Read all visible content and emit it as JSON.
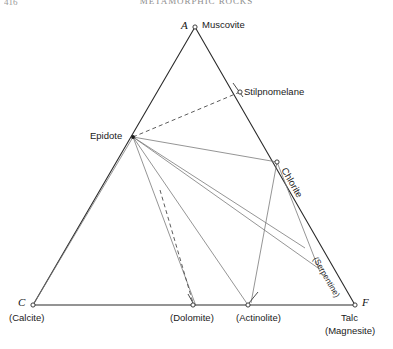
{
  "page": {
    "running_head": "METAMORPHIC ROCKS",
    "folio": "416"
  },
  "figure": {
    "type": "acf-ternary-diagram",
    "vertices": {
      "a": {
        "code": "A",
        "mineral": "Muscovite",
        "x": 195,
        "y": 27
      },
      "c": {
        "code": "C",
        "mineral": "(Calcite)",
        "x": 33,
        "y": 305
      },
      "f": {
        "code": "F",
        "mineral": "Talc",
        "mineral2": "(Magnesite)",
        "x": 355,
        "y": 305
      }
    },
    "nodes": [
      {
        "name": "Stilpnomelane",
        "x": 237,
        "y": 93
      },
      {
        "name": "Epidote",
        "x": 133,
        "y": 137
      },
      {
        "name": "Chlorite",
        "x": 277,
        "y": 162
      },
      {
        "name": "Dolomite",
        "x": 193,
        "y": 305
      },
      {
        "name": "Actinolite",
        "x": 248,
        "y": 305
      },
      {
        "name": "Serpentine",
        "x": 320,
        "y": 272
      }
    ],
    "labels": {
      "muscovite": "Muscovite",
      "stilpnomelane": "Stilpnomelane",
      "epidote": "Epidote",
      "chlorite": "Chlorite",
      "serpentine": "(Serpentine)",
      "calcite": "(Calcite)",
      "dolomite": "(Dolomite)",
      "actinolite": "(Actinolite)",
      "talc": "Talc",
      "magnesite": "(Magnesite)",
      "apex_a": "A",
      "apex_c": "C",
      "apex_f": "F"
    },
    "colors": {
      "triangle_stroke": "#2b2b2b",
      "tie_line_stroke": "#6f6f6f",
      "dashed_stroke": "#555555",
      "text": "#1a1a1a",
      "background": "#ffffff"
    }
  }
}
